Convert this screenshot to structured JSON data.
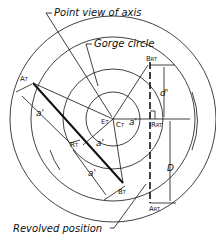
{
  "labels": {
    "point_view_of_axis": "Point view of axis",
    "gorge_circle": "Gorge circle",
    "revolved_position": "Revolved position"
  },
  "points": {
    "A": "A",
    "A_sub": "T",
    "B": "B",
    "B_sub": "T",
    "E": "E",
    "E_sub": "T",
    "C": "C",
    "C_sub": "T",
    "R": "R",
    "R_sub": "T",
    "BR": "B",
    "BR_sub": "RT",
    "AR": "A",
    "AR_sub": "RT",
    "RR": "R",
    "RR_sub": "RT"
  },
  "dimensions": {
    "d": "d",
    "d_prime": "d'",
    "a_prime": "a'",
    "D": "D"
  },
  "colors": {
    "line": "#111111",
    "background": "#ffffff"
  }
}
